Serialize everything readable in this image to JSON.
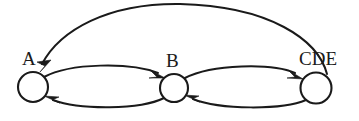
{
  "diagram": {
    "type": "state-transition-graph",
    "title": "",
    "background_color": "#ffffff",
    "stroke_color": "#1a1a1a",
    "node_fill_color": "#ffffff",
    "nodes": [
      {
        "id": "A",
        "label": "A",
        "cx": 33,
        "cy": 87,
        "r": 15,
        "label_x": 22,
        "label_y": 65
      },
      {
        "id": "B",
        "label": "B",
        "cx": 174,
        "cy": 88,
        "r": 14,
        "label_x": 166,
        "label_y": 67
      },
      {
        "id": "CDE",
        "label": "CDE",
        "cx": 316,
        "cy": 88,
        "r": 15.5,
        "label_x": 299,
        "label_y": 65
      }
    ],
    "edges": [
      {
        "id": "a-to-b",
        "from": "A",
        "to": "B",
        "style": "curve-upper",
        "direction": "forward"
      },
      {
        "id": "b-to-a",
        "from": "B",
        "to": "A",
        "style": "curve-lower",
        "direction": "forward"
      },
      {
        "id": "b-to-cde",
        "from": "B",
        "to": "CDE",
        "style": "curve-upper",
        "direction": "forward"
      },
      {
        "id": "cde-to-b",
        "from": "CDE",
        "to": "B",
        "style": "curve-lower",
        "direction": "forward"
      },
      {
        "id": "cde-to-a",
        "from": "CDE",
        "to": "A",
        "style": "arc-over-top",
        "direction": "forward"
      }
    ],
    "edge_count": 5,
    "node_count": 3
  }
}
